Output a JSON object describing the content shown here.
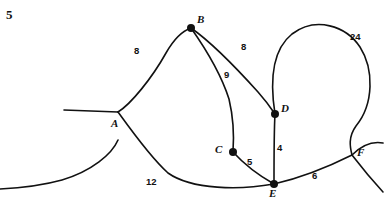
{
  "figure": {
    "problem_number": "5",
    "type": "weighted-graph-diagram",
    "stroke_color": "#111111",
    "background_color": "#ffffff"
  },
  "vertices": [
    {
      "id": "A",
      "label": "A",
      "x": 118,
      "y": 112,
      "label_x": 111,
      "label_y": 118,
      "dot": false
    },
    {
      "id": "B",
      "label": "B",
      "x": 191,
      "y": 28,
      "label_x": 197,
      "label_y": 14,
      "dot": true
    },
    {
      "id": "C",
      "label": "C",
      "x": 233,
      "y": 152,
      "label_x": 215,
      "label_y": 144,
      "dot": true
    },
    {
      "id": "D",
      "label": "D",
      "x": 275,
      "y": 114,
      "label_x": 281,
      "label_y": 103,
      "dot": true
    },
    {
      "id": "E",
      "label": "E",
      "x": 274,
      "y": 184,
      "label_x": 269,
      "label_y": 188,
      "dot": true
    },
    {
      "id": "F",
      "label": "F",
      "x": 352,
      "y": 155,
      "label_x": 357,
      "label_y": 147,
      "dot": false
    }
  ],
  "edges": [
    {
      "id": "AB",
      "from": "A",
      "to": "B",
      "weight": "8",
      "label_x": 134,
      "label_y": 46
    },
    {
      "id": "BD",
      "from": "B",
      "to": "D",
      "weight": "8",
      "label_x": 241,
      "label_y": 42
    },
    {
      "id": "BC",
      "from": "B",
      "to": "C",
      "weight": "9",
      "label_x": 224,
      "label_y": 70
    },
    {
      "id": "AE",
      "from": "A",
      "to": "E",
      "weight": "12",
      "label_x": 146,
      "label_y": 177
    },
    {
      "id": "CE",
      "from": "C",
      "to": "E",
      "weight": "5",
      "label_x": 247,
      "label_y": 157
    },
    {
      "id": "DE",
      "from": "D",
      "to": "E",
      "weight": "4",
      "label_x": 277,
      "label_y": 143
    },
    {
      "id": "EF",
      "from": "E",
      "to": "F",
      "weight": "6",
      "label_x": 312,
      "label_y": 171
    },
    {
      "id": "DF",
      "from": "D",
      "to": "F",
      "weight": "24",
      "label_x": 350,
      "label_y": 32
    }
  ],
  "paths": {
    "stub_left": "M 64,110 L 118,112",
    "AB": "M 118,112 C 131,104 152,78 166,53 C 174,39 182,31 191,28",
    "BD": "M 191,28 C 211,42 240,72 258,92 C 266,101 271,108 275,114",
    "BC": "M 191,28 C 203,45 221,74 229,99 C 233,116 234,138 233,152",
    "AE": "M 118,112 C 131,130 151,158 168,173 C 192,190 240,190 274,184",
    "CE": "M 233,152 C 243,163 258,175 274,184",
    "DE": "M 275,114 C 274,131 274,160 274,184",
    "EF": "M 274,184 C 300,178 330,166 352,155",
    "DF": "M 275,114 C 270,82 272,50 292,34 C 316,16 346,26 360,47 C 374,69 374,104 356,126 C 348,137 350,147 352,155",
    "stub_right_upper": "M 352,155 C 362,145 372,141 383,143",
    "stub_right_lower": "M 352,155 C 362,168 372,180 383,192",
    "stub_bottom_left": "M 0,189 C 20,188 44,185 62,180 C 92,171 112,154 118,140"
  }
}
